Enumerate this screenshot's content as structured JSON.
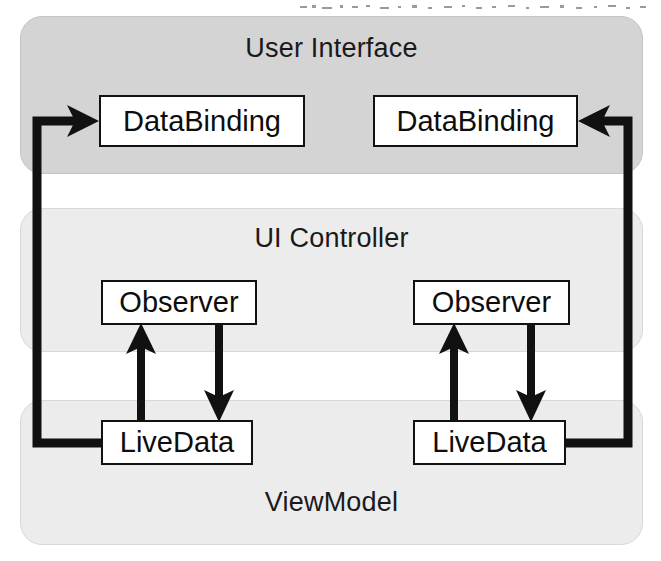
{
  "diagram": {
    "type": "architecture-block-diagram",
    "canvas": {
      "width": 661,
      "height": 561,
      "background": "#ffffff"
    },
    "colors": {
      "panel_fill": "#d4d4d4",
      "panel_fill_light": "#ebebeb",
      "panel_border": "#bdbdbd",
      "box_fill": "#ffffff",
      "box_border": "#111111",
      "arrow": "#111111",
      "text": "#121212"
    },
    "panels": [
      {
        "id": "user-interface",
        "label": "User Interface",
        "fill": "#d4d4d4",
        "x": 20,
        "y": 16,
        "width": 623,
        "height": 158
      },
      {
        "id": "ui-controller",
        "label": "UI Controller",
        "fill": "#ececec",
        "x": 20,
        "y": 208,
        "width": 623,
        "height": 144
      },
      {
        "id": "viewmodel",
        "label": "ViewModel",
        "fill": "#ececec",
        "x": 20,
        "y": 400,
        "width": 623,
        "height": 145
      }
    ],
    "nodes": [
      {
        "id": "databinding-left",
        "label": "DataBinding",
        "x": 99,
        "y": 95,
        "width": 206,
        "height": 52
      },
      {
        "id": "databinding-right",
        "label": "DataBinding",
        "x": 373,
        "y": 95,
        "width": 205,
        "height": 52
      },
      {
        "id": "observer-left",
        "label": "Observer",
        "x": 101,
        "y": 280,
        "width": 156,
        "height": 45
      },
      {
        "id": "observer-right",
        "label": "Observer",
        "x": 413,
        "y": 280,
        "width": 157,
        "height": 45
      },
      {
        "id": "livedata-left",
        "label": "LiveData",
        "x": 101,
        "y": 420,
        "width": 152,
        "height": 45
      },
      {
        "id": "livedata-right",
        "label": "LiveData",
        "x": 413,
        "y": 420,
        "width": 153,
        "height": 45
      }
    ],
    "connections": [
      {
        "id": "livedata-left-to-databinding-left",
        "from": "livedata-left",
        "to": "databinding-left",
        "style": "elbow-left",
        "arrowhead": "right"
      },
      {
        "id": "livedata-right-to-databinding-right",
        "from": "livedata-right",
        "to": "databinding-right",
        "style": "elbow-right",
        "arrowhead": "left"
      },
      {
        "id": "livedata-left-to-observer-left",
        "from": "livedata-left",
        "to": "observer-left",
        "style": "vertical",
        "arrowhead": "up"
      },
      {
        "id": "observer-left-to-livedata-left",
        "from": "observer-left",
        "to": "livedata-left",
        "style": "vertical",
        "arrowhead": "down"
      },
      {
        "id": "livedata-right-to-observer-right",
        "from": "livedata-right",
        "to": "observer-right",
        "style": "vertical",
        "arrowhead": "up"
      },
      {
        "id": "observer-right-to-livedata-right",
        "from": "observer-right",
        "to": "livedata-right",
        "style": "vertical",
        "arrowhead": "down"
      }
    ]
  }
}
